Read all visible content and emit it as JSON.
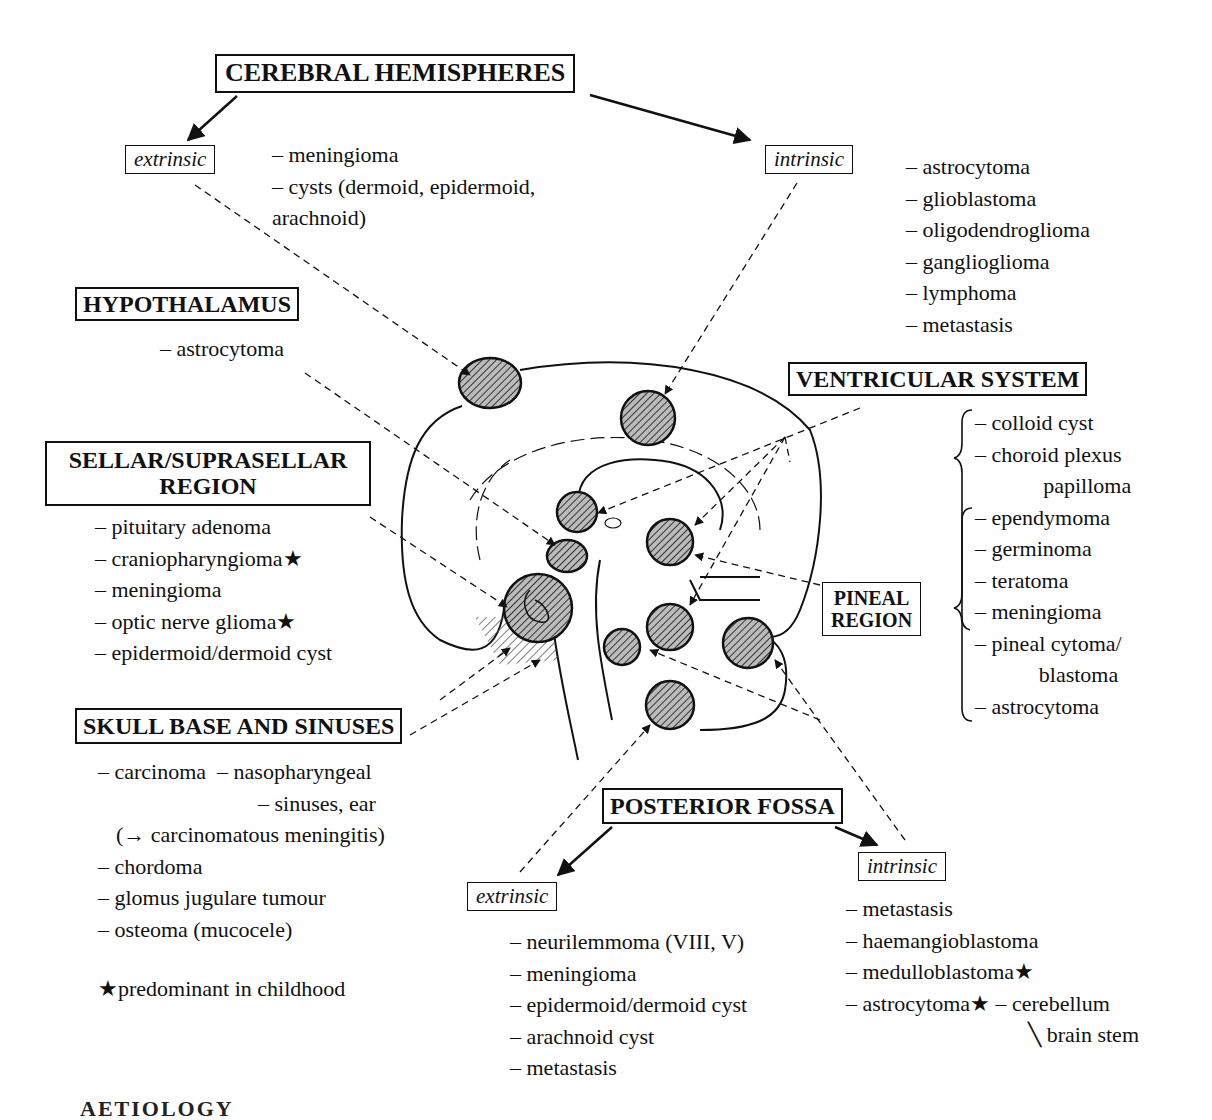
{
  "cerebral_hemispheres": {
    "title": "CEREBRAL HEMISPHERES",
    "extrinsic": {
      "label": "extrinsic",
      "items": [
        "– meningioma",
        "– cysts (dermoid, epidermoid,",
        "arachnoid)"
      ]
    },
    "intrinsic": {
      "label": "intrinsic",
      "items": [
        "– astrocytoma",
        "– glioblastoma",
        "– oligodendroglioma",
        "– ganglioglioma",
        "– lymphoma",
        "– metastasis"
      ]
    }
  },
  "hypothalamus": {
    "title": "HYPOTHALAMUS",
    "items": [
      "– astrocytoma"
    ]
  },
  "sellar": {
    "title_line1": "SELLAR/SUPRASELLAR",
    "title_line2": "REGION",
    "items": [
      "– pituitary adenoma",
      "– craniopharyngioma★",
      "– meningioma",
      "– optic nerve glioma★",
      "– epidermoid/dermoid cyst"
    ]
  },
  "ventricular_system": {
    "title": "VENTRICULAR SYSTEM",
    "items": [
      "– colloid cyst",
      "– choroid plexus",
      "papilloma",
      "– ependymoma",
      "– germinoma",
      "– teratoma",
      "– meningioma",
      "– pineal cytoma/",
      "blastoma",
      "– astrocytoma"
    ]
  },
  "pineal": {
    "title_line1": "PINEAL",
    "title_line2": "REGION"
  },
  "skull_base": {
    "title": "SKULL BASE AND SINUSES",
    "items": [
      "– carcinoma  – nasopharyngeal",
      "– sinuses, ear",
      "(→ carcinomatous meningitis)",
      "– chordoma",
      "– glomus jugulare tumour",
      "– osteoma (mucocele)"
    ],
    "footnote": "★predominant in childhood"
  },
  "posterior_fossa": {
    "title": "POSTERIOR FOSSA",
    "extrinsic": {
      "label": "extrinsic",
      "items": [
        "– neurilemmoma (VIII, V)",
        "– meningioma",
        "– epidermoid/dermoid cyst",
        "– arachnoid cyst",
        "– metastasis"
      ]
    },
    "intrinsic": {
      "label": "intrinsic",
      "items": [
        "– metastasis",
        "– haemangioblastoma",
        "– medulloblastoma★",
        "– astrocytoma★ – cerebellum",
        "╲ brain stem"
      ]
    }
  },
  "cutoff_heading": "AETIOLOGY"
}
